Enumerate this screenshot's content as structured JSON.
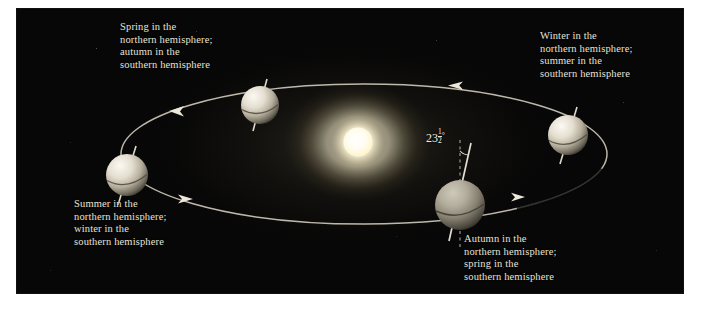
{
  "figure": {
    "kind": "earth-seasons-orbit-diagram",
    "panel_background": "#070707",
    "text_color": "#e8e3d6",
    "orbit_color": "#d8d3c4",
    "sun_color": "#fffdf2"
  },
  "sun": {
    "name": "Sun",
    "center_x": 341,
    "center_y": 133,
    "radius": 15
  },
  "tilt": {
    "whole": "23",
    "numerator": "1",
    "denominator": "2",
    "degree_symbol": "°",
    "plain": "23 1/2°"
  },
  "orbit": {
    "center_x": 347,
    "center_y": 145,
    "radius_x": 243,
    "radius_y": 70,
    "direction": "counterclockwise",
    "arrow_count": 4
  },
  "captions": {
    "spring": "Spring in the\nnorthern hemisphere;\nautumn in the\nsouthern hemisphere",
    "winter": "Winter in the\nnorthern hemisphere;\nsummer in the\nsouthern hemisphere",
    "summer": "Summer in the\nnorthern hemisphere;\nwinter in the\nsouthern hemisphere",
    "autumn": "Autumn in the\nnorthern hemisphere;\nspring in the\nsouthern hemisphere"
  },
  "earths": [
    {
      "id": "earth-spring",
      "label": "Earth at spring position",
      "cx": 243,
      "cy": 96,
      "r": 19
    },
    {
      "id": "earth-winter",
      "label": "Earth at winter position",
      "cx": 551,
      "cy": 126,
      "r": 20
    },
    {
      "id": "earth-summer",
      "label": "Earth at summer position",
      "cx": 110,
      "cy": 166,
      "r": 21
    },
    {
      "id": "earth-autumn",
      "label": "Earth at autumn position",
      "cx": 443,
      "cy": 196,
      "r": 25
    }
  ]
}
